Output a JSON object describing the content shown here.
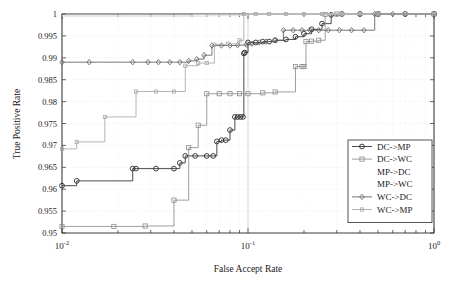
{
  "chart_data": {
    "type": "line",
    "title": "",
    "xlabel": "False Accept Rate",
    "ylabel": "True Positive Rate",
    "xscale": "log",
    "yscale": "linear",
    "xlim": [
      0.01,
      1.0
    ],
    "ylim": [
      0.95,
      1.0
    ],
    "grid": true,
    "legend_position": "lower right",
    "xticks": [
      0.01,
      0.1,
      1.0
    ],
    "xticklabels": [
      "10^-2",
      "10^-1",
      "10^0"
    ],
    "yticks": [
      0.95,
      0.955,
      0.96,
      0.965,
      0.97,
      0.975,
      0.98,
      0.985,
      0.99,
      0.995,
      1
    ],
    "yticklabels": [
      "0.95",
      "0.955",
      "0.96",
      "0.965",
      "0.97",
      "0.975",
      "0.98",
      "0.985",
      "0.99",
      "0.995",
      "1"
    ],
    "series": [
      {
        "name": "DC->MP",
        "color": "#2b2b2b",
        "marker": "circle",
        "points": [
          [
            0.01,
            0.9608
          ],
          [
            0.012,
            0.9619
          ],
          [
            0.024,
            0.9647
          ],
          [
            0.025,
            0.9647
          ],
          [
            0.032,
            0.9647
          ],
          [
            0.04,
            0.9647
          ],
          [
            0.043,
            0.966
          ],
          [
            0.046,
            0.9676
          ],
          [
            0.052,
            0.9676
          ],
          [
            0.06,
            0.9676
          ],
          [
            0.065,
            0.9676
          ],
          [
            0.068,
            0.9709
          ],
          [
            0.072,
            0.9712
          ],
          [
            0.076,
            0.9712
          ],
          [
            0.08,
            0.9735
          ],
          [
            0.085,
            0.9765
          ],
          [
            0.088,
            0.9765
          ],
          [
            0.091,
            0.9765
          ],
          [
            0.094,
            0.9765
          ],
          [
            0.095,
            0.991
          ],
          [
            0.096,
            0.9912
          ],
          [
            0.1,
            0.9935
          ],
          [
            0.11,
            0.9935
          ],
          [
            0.12,
            0.9937
          ],
          [
            0.13,
            0.9937
          ],
          [
            0.14,
            0.994
          ],
          [
            0.16,
            0.9942
          ],
          [
            0.18,
            0.9948
          ],
          [
            0.2,
            0.9955
          ],
          [
            0.22,
            0.9965
          ],
          [
            0.25,
            0.9978
          ],
          [
            0.28,
            0.9998
          ],
          [
            0.32,
            1.0
          ],
          [
            0.4,
            1.0
          ],
          [
            0.5,
            1.0
          ],
          [
            0.7,
            1.0
          ],
          [
            1.0,
            1.0
          ]
        ]
      },
      {
        "name": "DC->WC",
        "color": "#8c8c8c",
        "marker": "square",
        "points": [
          [
            0.01,
            0.9515
          ],
          [
            0.019,
            0.9515
          ],
          [
            0.028,
            0.9516
          ],
          [
            0.04,
            0.9575
          ],
          [
            0.048,
            0.9695
          ],
          [
            0.054,
            0.9746
          ],
          [
            0.06,
            0.9818
          ],
          [
            0.07,
            0.9818
          ],
          [
            0.08,
            0.9818
          ],
          [
            0.09,
            0.9818
          ],
          [
            0.1,
            0.9818
          ],
          [
            0.12,
            0.982
          ],
          [
            0.14,
            0.9822
          ],
          [
            0.18,
            0.988
          ],
          [
            0.195,
            0.988
          ],
          [
            0.2,
            0.988
          ],
          [
            0.205,
            0.9937
          ],
          [
            0.22,
            0.9938
          ],
          [
            0.24,
            0.994
          ],
          [
            0.26,
            0.9999
          ],
          [
            0.3,
            1.0
          ],
          [
            0.5,
            1.0
          ],
          [
            1.0,
            1.0
          ]
        ]
      },
      {
        "name": "MP->DC",
        "color": "#d8d8d8",
        "marker": "none",
        "points": [
          [
            0.01,
            0.9995
          ],
          [
            0.04,
            0.9995
          ],
          [
            0.06,
            0.9996
          ],
          [
            0.09,
            0.9997
          ],
          [
            0.095,
            1.0
          ],
          [
            0.14,
            1.0
          ],
          [
            0.3,
            1.0
          ],
          [
            1.0,
            1.0
          ]
        ]
      },
      {
        "name": "MP->WC",
        "color": "#e2e2e2",
        "marker": "none",
        "points": [
          [
            0.01,
            0.9997
          ],
          [
            0.05,
            0.9998
          ],
          [
            0.1,
            1.0
          ],
          [
            0.4,
            1.0
          ],
          [
            1.0,
            1.0
          ]
        ]
      },
      {
        "name": "WC->DC",
        "color": "#5e5e5e",
        "marker": "diamond",
        "points": [
          [
            0.01,
            0.989
          ],
          [
            0.014,
            0.989
          ],
          [
            0.024,
            0.989
          ],
          [
            0.029,
            0.989
          ],
          [
            0.033,
            0.989
          ],
          [
            0.038,
            0.989
          ],
          [
            0.043,
            0.989
          ],
          [
            0.048,
            0.9893
          ],
          [
            0.053,
            0.9897
          ],
          [
            0.058,
            0.9906
          ],
          [
            0.064,
            0.9928
          ],
          [
            0.072,
            0.9928
          ],
          [
            0.08,
            0.9928
          ],
          [
            0.088,
            0.9929
          ],
          [
            0.098,
            0.993
          ],
          [
            0.105,
            0.9932
          ],
          [
            0.115,
            0.9935
          ],
          [
            0.125,
            0.9937
          ],
          [
            0.14,
            0.994
          ],
          [
            0.155,
            0.9963
          ],
          [
            0.175,
            0.9963
          ],
          [
            0.195,
            0.9963
          ],
          [
            0.215,
            0.9963
          ],
          [
            0.24,
            0.9963
          ],
          [
            0.27,
            0.9963
          ],
          [
            0.31,
            0.9963
          ],
          [
            0.36,
            0.9963
          ],
          [
            0.42,
            0.9963
          ],
          [
            0.48,
            1.0
          ],
          [
            0.6,
            1.0
          ],
          [
            1.0,
            1.0
          ]
        ]
      },
      {
        "name": "WC->MP",
        "color": "#a8a8a8",
        "marker": "small-square",
        "points": [
          [
            0.01,
            0.9692
          ],
          [
            0.012,
            0.9708
          ],
          [
            0.017,
            0.9765
          ],
          [
            0.025,
            0.9823
          ],
          [
            0.032,
            0.9823
          ],
          [
            0.04,
            0.9823
          ],
          [
            0.046,
            0.9882
          ],
          [
            0.054,
            0.9888
          ],
          [
            0.06,
            0.9888
          ],
          [
            0.066,
            0.993
          ],
          [
            0.078,
            0.9932
          ],
          [
            0.09,
            0.994
          ],
          [
            0.095,
            1.0
          ],
          [
            0.11,
            1.0
          ],
          [
            0.13,
            1.0
          ],
          [
            0.16,
            1.0
          ],
          [
            0.2,
            1.0
          ],
          [
            0.25,
            1.0
          ],
          [
            0.32,
            1.0
          ],
          [
            0.5,
            1.0
          ],
          [
            1.0,
            1.0
          ]
        ]
      }
    ],
    "legend_entries": [
      {
        "label": "DC->MP",
        "color": "#2b2b2b",
        "marker": "circle",
        "show_line": true
      },
      {
        "label": "DC->WC",
        "color": "#8c8c8c",
        "marker": "square",
        "show_line": true
      },
      {
        "label": "MP->DC",
        "color": "#dcdcdc",
        "marker": "none",
        "show_line": false
      },
      {
        "label": "MP->WC",
        "color": "#e6e6e6",
        "marker": "none",
        "show_line": false
      },
      {
        "label": "WC->DC",
        "color": "#5e5e5e",
        "marker": "diamond",
        "show_line": true
      },
      {
        "label": "WC->MP",
        "color": "#a8a8a8",
        "marker": "small-square",
        "show_line": true
      }
    ]
  }
}
